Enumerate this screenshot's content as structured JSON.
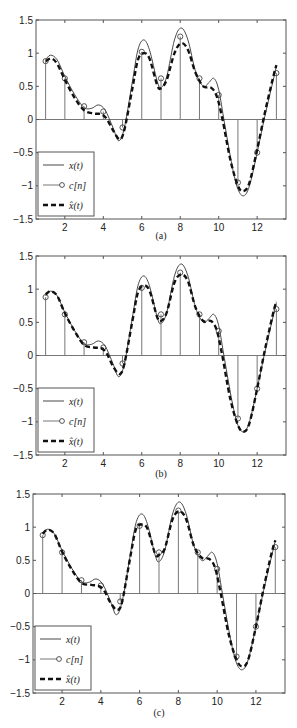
{
  "chart_data": [
    {
      "type": "line",
      "caption": "(a)",
      "xlim": [
        0.5,
        13.5
      ],
      "ylim": [
        -1.5,
        1.5
      ],
      "xticks": [
        2,
        4,
        6,
        8,
        10,
        12
      ],
      "yticks": [
        1.5,
        1,
        0.5,
        0,
        -0.5,
        -1,
        -1.5
      ],
      "ytick_labels": [
        "1.5",
        "1",
        "0.5",
        "0",
        "-0.5",
        "-1",
        "-1.5"
      ],
      "legend": {
        "position": "lower left",
        "entries": [
          "x(t)",
          "c[n]",
          "x̂(t)"
        ]
      },
      "series": [
        {
          "name": "x(t)",
          "style": "solid thin",
          "x": [
            1.0,
            1.25,
            1.6,
            2.0,
            2.5,
            3.0,
            3.4,
            3.75,
            4.1,
            4.5,
            4.8,
            5.1,
            5.5,
            5.8,
            6.1,
            6.4,
            6.8,
            7.0,
            7.3,
            7.7,
            8.05,
            8.4,
            8.8,
            9.2,
            9.5,
            9.75,
            10.0,
            10.3,
            10.7,
            11.0,
            11.3,
            11.6,
            12.0,
            12.4,
            12.8,
            13.0
          ],
          "y": [
            0.9,
            0.97,
            0.9,
            0.65,
            0.38,
            0.18,
            0.17,
            0.22,
            0.14,
            -0.12,
            -0.32,
            -0.12,
            0.55,
            1.05,
            1.2,
            1.05,
            0.58,
            0.48,
            0.65,
            1.2,
            1.38,
            1.2,
            0.72,
            0.5,
            0.56,
            0.62,
            0.45,
            -0.05,
            -0.7,
            -1.05,
            -1.15,
            -1.0,
            -0.5,
            0.05,
            0.55,
            0.8
          ]
        },
        {
          "name": "c[n]",
          "style": "stem",
          "x": [
            1,
            2,
            3,
            4,
            5,
            6,
            7,
            8,
            9,
            10,
            11,
            12,
            13
          ],
          "y": [
            0.88,
            0.62,
            0.2,
            0.12,
            -0.12,
            1.02,
            0.62,
            1.25,
            0.62,
            0.37,
            -0.95,
            -0.5,
            0.7
          ]
        },
        {
          "name": "x̂(t)",
          "style": "dashed thick",
          "x": [
            1.0,
            1.3,
            1.6,
            2.0,
            2.5,
            3.0,
            3.5,
            3.9,
            4.2,
            4.5,
            4.85,
            5.1,
            5.5,
            5.8,
            6.1,
            6.4,
            6.8,
            7.0,
            7.3,
            7.7,
            8.05,
            8.4,
            8.8,
            9.2,
            9.6,
            9.9,
            10.2,
            10.6,
            11.0,
            11.3,
            11.6,
            12.0,
            12.4,
            12.8,
            13.0
          ],
          "y": [
            0.88,
            0.92,
            0.84,
            0.6,
            0.33,
            0.14,
            0.09,
            0.08,
            0.0,
            -0.16,
            -0.3,
            -0.15,
            0.45,
            0.9,
            1.0,
            0.92,
            0.52,
            0.47,
            0.6,
            1.0,
            1.15,
            1.05,
            0.7,
            0.5,
            0.48,
            0.35,
            0.0,
            -0.6,
            -1.0,
            -1.08,
            -0.95,
            -0.45,
            0.1,
            0.6,
            0.82
          ]
        }
      ]
    },
    {
      "type": "line",
      "caption": "(b)",
      "xlim": [
        0.5,
        13.5
      ],
      "ylim": [
        -1.5,
        1.5
      ],
      "xticks": [
        2,
        4,
        6,
        8,
        10,
        12
      ],
      "yticks": [
        1.5,
        1,
        0.5,
        0,
        -0.5,
        -1,
        -1.5
      ],
      "ytick_labels": [
        "1.5",
        "1",
        "0.5",
        "0",
        "-0.5",
        "-1",
        "-1.5"
      ],
      "legend": {
        "position": "lower left",
        "entries": [
          "x(t)",
          "c[n]",
          "x̂(t)"
        ]
      },
      "series": [
        {
          "name": "x(t)",
          "style": "solid thin",
          "x": [
            1.0,
            1.25,
            1.6,
            2.0,
            2.5,
            3.0,
            3.4,
            3.75,
            4.1,
            4.5,
            4.8,
            5.1,
            5.5,
            5.8,
            6.1,
            6.4,
            6.8,
            7.0,
            7.3,
            7.7,
            8.05,
            8.4,
            8.8,
            9.2,
            9.5,
            9.75,
            10.0,
            10.3,
            10.7,
            11.0,
            11.3,
            11.6,
            12.0,
            12.4,
            12.8,
            13.0
          ],
          "y": [
            0.9,
            0.97,
            0.9,
            0.65,
            0.38,
            0.18,
            0.17,
            0.22,
            0.14,
            -0.12,
            -0.32,
            -0.12,
            0.55,
            1.05,
            1.2,
            1.05,
            0.58,
            0.48,
            0.65,
            1.2,
            1.38,
            1.2,
            0.72,
            0.5,
            0.56,
            0.62,
            0.45,
            -0.05,
            -0.7,
            -1.05,
            -1.15,
            -1.0,
            -0.5,
            0.05,
            0.55,
            0.8
          ]
        },
        {
          "name": "c[n]",
          "style": "stem",
          "x": [
            1,
            2,
            3,
            4,
            5,
            6,
            7,
            8,
            9,
            10,
            11,
            12,
            13
          ],
          "y": [
            0.88,
            0.62,
            0.2,
            0.12,
            -0.12,
            1.02,
            0.62,
            1.25,
            0.62,
            0.37,
            -0.95,
            -0.5,
            0.7
          ]
        },
        {
          "name": "x̂(t)",
          "style": "dashed thick",
          "x": [
            1.0,
            1.25,
            1.6,
            2.0,
            2.5,
            3.0,
            3.5,
            3.9,
            4.2,
            4.5,
            4.85,
            5.1,
            5.5,
            5.8,
            6.1,
            6.4,
            6.8,
            7.0,
            7.3,
            7.7,
            8.05,
            8.4,
            8.8,
            9.2,
            9.6,
            9.9,
            10.2,
            10.6,
            11.0,
            11.3,
            11.6,
            12.0,
            12.4,
            12.8,
            13.0
          ],
          "y": [
            0.92,
            0.97,
            0.9,
            0.64,
            0.37,
            0.16,
            0.12,
            0.11,
            0.02,
            -0.16,
            -0.28,
            -0.12,
            0.5,
            0.95,
            1.05,
            0.98,
            0.58,
            0.52,
            0.65,
            1.1,
            1.22,
            1.12,
            0.72,
            0.52,
            0.52,
            0.38,
            -0.02,
            -0.65,
            -1.05,
            -1.15,
            -1.02,
            -0.5,
            0.08,
            0.6,
            0.82
          ]
        }
      ]
    },
    {
      "type": "line",
      "caption": "(c)",
      "xlim": [
        0.5,
        13.5
      ],
      "ylim": [
        -1.5,
        1.5
      ],
      "xticks": [
        2,
        4,
        6,
        8,
        10,
        12
      ],
      "yticks": [
        1.5,
        1,
        0.5,
        0,
        -0.5,
        -1,
        -1.5
      ],
      "ytick_labels": [
        "1.5",
        "1",
        "0.5",
        "0",
        "-0.5",
        "-1",
        "-1.5"
      ],
      "legend": {
        "position": "lower left",
        "entries": [
          "x(t)",
          "c[n]",
          "x̂(t)"
        ]
      },
      "series": [
        {
          "name": "x(t)",
          "style": "solid thin",
          "x": [
            1.0,
            1.25,
            1.6,
            2.0,
            2.5,
            3.0,
            3.4,
            3.75,
            4.1,
            4.5,
            4.8,
            5.1,
            5.5,
            5.8,
            6.1,
            6.4,
            6.8,
            7.0,
            7.3,
            7.7,
            8.05,
            8.4,
            8.8,
            9.2,
            9.5,
            9.75,
            10.0,
            10.3,
            10.7,
            11.0,
            11.3,
            11.6,
            12.0,
            12.4,
            12.8,
            13.0
          ],
          "y": [
            0.9,
            0.97,
            0.9,
            0.65,
            0.38,
            0.18,
            0.17,
            0.22,
            0.14,
            -0.12,
            -0.32,
            -0.12,
            0.55,
            1.05,
            1.2,
            1.05,
            0.58,
            0.48,
            0.65,
            1.2,
            1.38,
            1.2,
            0.72,
            0.5,
            0.56,
            0.62,
            0.45,
            -0.05,
            -0.7,
            -1.05,
            -1.15,
            -1.0,
            -0.5,
            0.05,
            0.55,
            0.8
          ]
        },
        {
          "name": "c[n]",
          "style": "stem",
          "x": [
            1,
            2,
            3,
            4,
            5,
            6,
            7,
            8,
            9,
            10,
            11,
            12,
            13
          ],
          "y": [
            0.88,
            0.62,
            0.2,
            0.12,
            -0.12,
            1.02,
            0.62,
            1.25,
            0.62,
            0.37,
            -0.95,
            -0.5,
            0.7
          ]
        },
        {
          "name": "x̂(t)",
          "style": "dashed thick",
          "x": [
            1.0,
            1.25,
            1.6,
            2.0,
            2.5,
            3.0,
            3.5,
            3.9,
            4.2,
            4.5,
            4.85,
            5.1,
            5.5,
            5.8,
            6.1,
            6.4,
            6.8,
            7.0,
            7.3,
            7.7,
            8.05,
            8.4,
            8.8,
            9.2,
            9.6,
            9.9,
            10.2,
            10.6,
            11.0,
            11.3,
            11.6,
            12.0,
            12.4,
            12.8,
            13.0
          ],
          "y": [
            0.9,
            0.96,
            0.9,
            0.63,
            0.36,
            0.16,
            0.13,
            0.11,
            0.03,
            -0.14,
            -0.25,
            -0.12,
            0.52,
            0.96,
            1.04,
            0.98,
            0.6,
            0.58,
            0.68,
            1.12,
            1.24,
            1.12,
            0.72,
            0.54,
            0.52,
            0.38,
            -0.02,
            -0.62,
            -1.0,
            -1.1,
            -1.0,
            -0.5,
            0.08,
            0.6,
            0.8
          ]
        }
      ]
    }
  ],
  "panels_layout": [
    {
      "top": 0,
      "height": 245,
      "axes": {
        "left": 36,
        "right": 286,
        "top": 20,
        "bottom": 219
      },
      "caption_y": 239
    },
    {
      "top": 245,
      "height": 240,
      "axes": {
        "left": 36,
        "right": 286,
        "top": 11,
        "bottom": 210
      },
      "caption_y": 232
    },
    {
      "top": 485,
      "height": 243,
      "axes": {
        "left": 33,
        "right": 285,
        "top": 9,
        "bottom": 208
      },
      "caption_y": 231
    }
  ],
  "colors": {
    "axes": "#555555",
    "x_curve": "#333333",
    "stem": "#777777",
    "recon": "#111111",
    "legend_border": "#555555"
  }
}
